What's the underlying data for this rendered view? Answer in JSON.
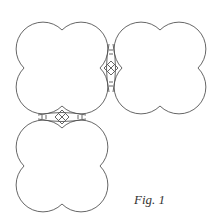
{
  "figure": {
    "caption": "Fig. 1",
    "stroke_color": "#555555",
    "shapes": [
      {
        "name": "quatrefoil-top-left",
        "cx": 62,
        "cy": 68
      },
      {
        "name": "quatrefoil-top-right",
        "cx": 160,
        "cy": 68
      },
      {
        "name": "quatrefoil-bottom-left",
        "cx": 62,
        "cy": 166
      }
    ],
    "connectors": [
      {
        "name": "connector-vertical",
        "orientation": "vertical",
        "x": 111,
        "y": 68
      },
      {
        "name": "connector-horizontal",
        "orientation": "horizontal",
        "x": 62,
        "y": 117
      }
    ]
  }
}
